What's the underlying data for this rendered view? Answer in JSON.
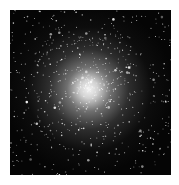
{
  "image": {
    "subject": "Globular star cluster",
    "description": "Dense spherical cluster of stars with a bright white core on a black background",
    "colors": {
      "background": "#050505",
      "core": "#ffffff",
      "frame": "#ffffff"
    }
  }
}
